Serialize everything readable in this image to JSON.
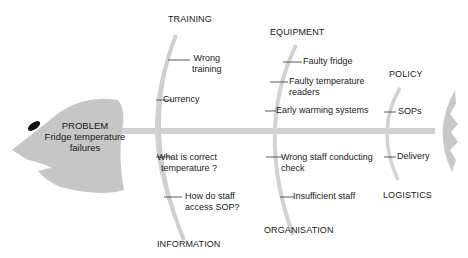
{
  "problem": {
    "title": "PROBLEM",
    "line1": "Fridge temperature",
    "line2": "failures"
  },
  "categories": {
    "training": {
      "label": "TRAINING",
      "causes": [
        "Wrong",
        "training",
        "Currency"
      ]
    },
    "information": {
      "label": "INFORMATION",
      "causes": [
        "What is correct",
        "temperature ?",
        "How do staff",
        "access SOP?"
      ]
    },
    "equipment": {
      "label": "EQUIPMENT",
      "causes": [
        "Faulty fridge",
        "Faulty temperature",
        "readers",
        "Early warming systems"
      ]
    },
    "organisation": {
      "label": "ORGANISATION",
      "causes": [
        "Wrong staff conducting",
        "check",
        "Insufficient staff"
      ]
    },
    "policy": {
      "label": "POLICY",
      "causes": [
        "SOPs"
      ]
    },
    "logistics": {
      "label": "LOGISTICS",
      "causes": [
        "Delivery"
      ]
    }
  },
  "colors": {
    "fish_gray": "#c8c8c8",
    "bone_gray": "#d4d4d4",
    "eye": "#111111",
    "text": "#1a1a1a"
  }
}
